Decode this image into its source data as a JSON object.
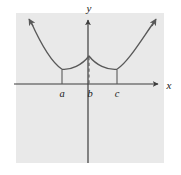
{
  "figure": {
    "kind": "cartesian-graph",
    "width": 181,
    "height": 175,
    "background_color": "#ffffff",
    "panel_color": "#e9e9e9",
    "panel": {
      "x": 16,
      "y": 13,
      "width": 148,
      "height": 150
    },
    "ink_color": "#4a4a4a",
    "axis_color": "#3d3d3d",
    "curve_color": "#595959"
  },
  "axes": {
    "x_label": "x",
    "y_label": "y",
    "x_axis_y": 84,
    "y_axis_x": 88,
    "x_axis_start": 14,
    "x_axis_end": 160,
    "y_axis_top": 18,
    "y_axis_bottom": 163,
    "arrowheads": [
      "x-positive",
      "y-positive"
    ]
  },
  "marks": [
    {
      "id": "a",
      "label": "a",
      "x": 62,
      "label_x": 62,
      "label_y": 96,
      "style": "solid",
      "tick_top": 70,
      "tick_bottom": 84
    },
    {
      "id": "b",
      "label": "b",
      "x": 89,
      "label_x": 89,
      "label_y": 96,
      "style": "dashed",
      "tick_top": 57,
      "tick_bottom": 84
    },
    {
      "id": "c",
      "label": "c",
      "x": 117,
      "label_x": 117,
      "label_y": 96,
      "style": "solid",
      "tick_top": 70,
      "tick_bottom": 84
    }
  ],
  "chart_data": {
    "type": "line",
    "title": "",
    "xlabel": "x",
    "ylabel": "y",
    "grid": false,
    "legend": null,
    "annotations": [
      "a",
      "b",
      "c"
    ],
    "features": [
      {
        "at": "a",
        "kind": "smooth-local-minimum"
      },
      {
        "at": "b",
        "kind": "cusp-local-maximum"
      },
      {
        "at": "c",
        "kind": "smooth-local-minimum"
      }
    ],
    "x": [
      28,
      34,
      40,
      46,
      52,
      58,
      62,
      66,
      72,
      78,
      84,
      89,
      94,
      100,
      106,
      112,
      117,
      122,
      128,
      134,
      140,
      146,
      152,
      157
    ],
    "y": [
      18,
      26,
      35,
      44,
      53,
      62,
      68,
      70,
      68,
      64,
      60,
      56,
      60,
      64,
      68,
      70,
      69,
      67,
      62,
      55,
      46,
      37,
      27,
      18
    ],
    "curve_path": "M 28,18 C 38,40 50,62 62,69.5 C 72,70 82,66 89,56 C 96,66 106,70 117,69.5 C 129,62 141,40 157,18",
    "arrow_tips": [
      {
        "x": 28,
        "y": 18
      },
      {
        "x": 157,
        "y": 18
      }
    ]
  }
}
